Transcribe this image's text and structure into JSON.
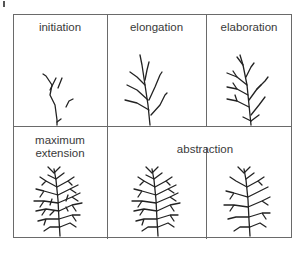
{
  "figure": {
    "stages": [
      {
        "id": "initiation",
        "label": "initiation"
      },
      {
        "id": "elongation",
        "label": "elongation"
      },
      {
        "id": "elaboration",
        "label": "elaboration"
      },
      {
        "id": "maximum-extension",
        "label": "maximum\nextension"
      },
      {
        "id": "abstraction",
        "label": "abstraction"
      }
    ],
    "line_color": "#6a6a6a",
    "tree_color": "#222222"
  }
}
